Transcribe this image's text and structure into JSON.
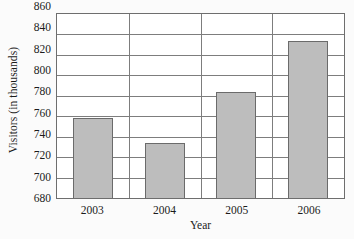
{
  "chart_data": {
    "type": "bar",
    "title": "",
    "xlabel": "Year",
    "ylabel": "Visitors (in thousands)",
    "categories": [
      "2003",
      "2004",
      "2005",
      "2006"
    ],
    "values": [
      758,
      734,
      784,
      834
    ],
    "ylim": [
      680,
      860
    ],
    "ytick_step": 20,
    "yticks": [
      680,
      700,
      720,
      740,
      760,
      780,
      800,
      820,
      840,
      860
    ],
    "ytick_labels": [
      "680",
      "700",
      "720",
      "740",
      "760",
      "780",
      "800",
      "820",
      "840",
      "860"
    ],
    "grid": "horizontal",
    "legend": "none",
    "series": [
      {
        "name": "Visitors",
        "values": [
          758,
          734,
          784,
          834
        ]
      }
    ],
    "colors": {
      "bar_fill": "#bdbdbd",
      "bar_edge": "#6b6b6b",
      "gridline": "#7d7d7d",
      "axis": "#6e6e6e",
      "text": "#1b1b1b",
      "background": "#fbfbfb",
      "plot_background": "#ffffff"
    }
  }
}
